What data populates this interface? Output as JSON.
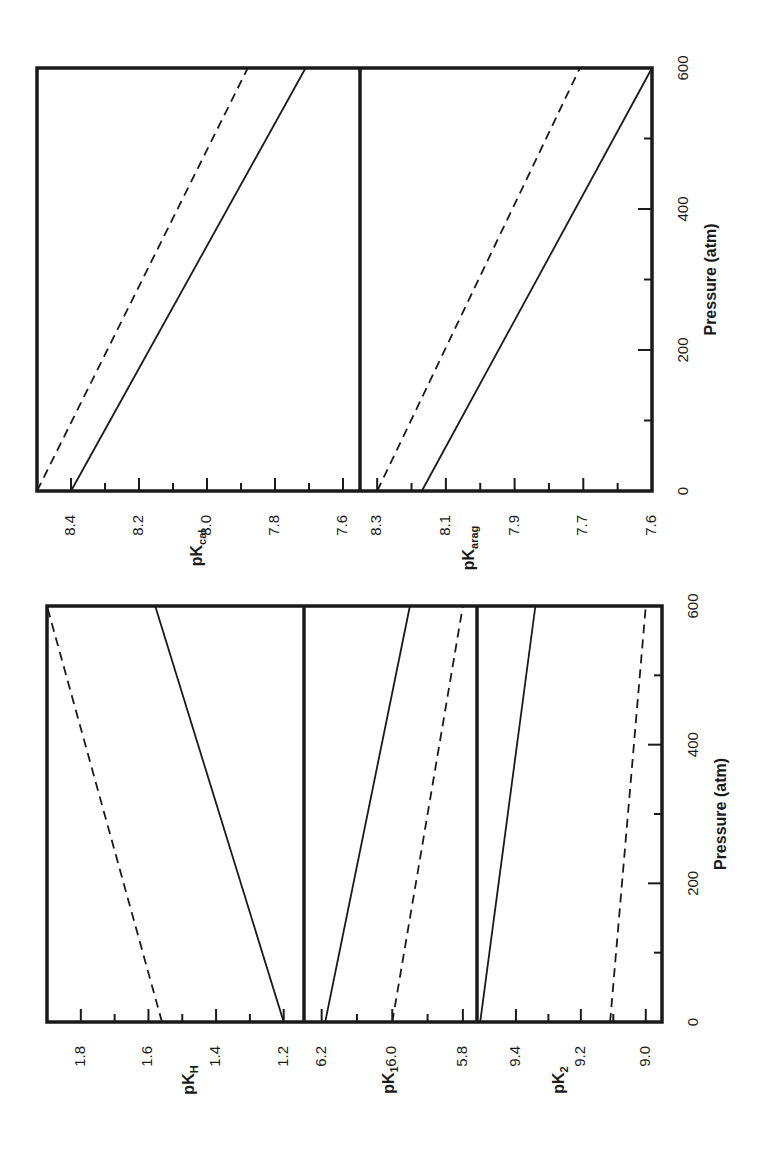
{
  "figure": {
    "orientation": "rotated-90-ccw",
    "ink_color": "#1a1a1a",
    "background": "#ffffff"
  },
  "chart_data": [
    {
      "type": "line",
      "panel_id": "pKcal",
      "ylabel_main": "pK",
      "ylabel_sub": "cal",
      "xlabel": "Pressure (atm)",
      "x_ticks": [
        0,
        200,
        400,
        600
      ],
      "x_minor_ticks": [
        100,
        300,
        500
      ],
      "xlim": [
        0,
        600
      ],
      "y_tick_labels": [
        "8.4",
        "8.2",
        "8.0",
        "7.8",
        "7.6"
      ],
      "y_tick_values": [
        8.4,
        8.2,
        8.0,
        7.8,
        7.6
      ],
      "y_minor_ticks": [
        8.3,
        8.1,
        7.9,
        7.7
      ],
      "ylim": [
        8.5,
        7.55
      ],
      "series": [
        {
          "name": "solid",
          "style": "solid",
          "x": [
            0,
            600
          ],
          "y": [
            8.4,
            7.71
          ]
        },
        {
          "name": "dashed",
          "style": "dashed",
          "x": [
            0,
            600
          ],
          "y": [
            8.5,
            7.88
          ]
        }
      ]
    },
    {
      "type": "line",
      "panel_id": "pKarag",
      "ylabel_main": "pK",
      "ylabel_sub": "arag",
      "xlabel": "Pressure (atm)",
      "x_ticks": [
        0,
        200,
        400,
        600
      ],
      "x_minor_ticks": [
        100,
        300,
        500
      ],
      "xlim": [
        0,
        600
      ],
      "y_tick_labels": [
        "8.3",
        "8.1",
        "7.9",
        "7.7",
        "7.6"
      ],
      "y_tick_values": [
        8.3,
        8.1,
        7.9,
        7.7,
        7.5
      ],
      "y_minor_ticks": [
        8.2,
        8.0,
        7.8,
        7.6
      ],
      "ylim": [
        8.35,
        7.5
      ],
      "series": [
        {
          "name": "solid",
          "style": "solid",
          "x": [
            0,
            600
          ],
          "y": [
            8.17,
            7.5
          ]
        },
        {
          "name": "dashed",
          "style": "dashed",
          "x": [
            0,
            600
          ],
          "y": [
            8.3,
            7.71
          ]
        }
      ]
    },
    {
      "type": "line",
      "panel_id": "pKH",
      "ylabel_main": "pK",
      "ylabel_sub": "H",
      "xlabel": "Pressure (atm)",
      "x_ticks": [
        0,
        200,
        400,
        600
      ],
      "x_minor_ticks": [
        100,
        300,
        500
      ],
      "xlim": [
        0,
        600
      ],
      "y_tick_labels": [
        "1.8",
        "1.6",
        "1.4",
        "1.2"
      ],
      "y_tick_values": [
        1.8,
        1.6,
        1.4,
        1.2
      ],
      "y_minor_ticks": [
        1.7,
        1.5,
        1.3
      ],
      "ylim": [
        1.9,
        1.14
      ],
      "series": [
        {
          "name": "solid",
          "style": "solid",
          "x": [
            0,
            600
          ],
          "y": [
            1.2,
            1.58
          ]
        },
        {
          "name": "dashed",
          "style": "dashed",
          "x": [
            0,
            600
          ],
          "y": [
            1.56,
            1.9
          ]
        }
      ]
    },
    {
      "type": "line",
      "panel_id": "pK1",
      "ylabel_main": "pK",
      "ylabel_sub": "1",
      "xlabel": "Pressure (atm)",
      "x_ticks": [
        0,
        200,
        400,
        600
      ],
      "x_minor_ticks": [
        100,
        300,
        500
      ],
      "xlim": [
        0,
        600
      ],
      "y_tick_labels": [
        "6.2",
        "6.0",
        "5.8"
      ],
      "y_tick_values": [
        6.2,
        6.0,
        5.8
      ],
      "y_minor_ticks": [
        6.1,
        5.9
      ],
      "ylim": [
        6.25,
        5.76
      ],
      "series": [
        {
          "name": "solid",
          "style": "solid",
          "x": [
            0,
            600
          ],
          "y": [
            6.19,
            5.95
          ]
        },
        {
          "name": "dashed",
          "style": "dashed",
          "x": [
            0,
            600
          ],
          "y": [
            6.0,
            5.8
          ]
        }
      ]
    },
    {
      "type": "line",
      "panel_id": "pK2",
      "ylabel_main": "pK",
      "ylabel_sub": "2",
      "xlabel": "Pressure (atm)",
      "x_ticks": [
        0,
        200,
        400,
        600
      ],
      "x_minor_ticks": [
        100,
        300,
        500
      ],
      "xlim": [
        0,
        600
      ],
      "y_tick_labels": [
        "9.4",
        "9.2",
        "9.0"
      ],
      "y_tick_values": [
        9.4,
        9.2,
        9.0
      ],
      "y_minor_ticks": [
        9.3,
        9.1
      ],
      "ylim": [
        9.52,
        8.95
      ],
      "series": [
        {
          "name": "solid",
          "style": "solid",
          "x": [
            0,
            600
          ],
          "y": [
            9.51,
            9.34
          ]
        },
        {
          "name": "dashed",
          "style": "dashed",
          "x": [
            0,
            600
          ],
          "y": [
            9.11,
            9.0
          ]
        }
      ]
    }
  ],
  "layout": {
    "figures": [
      {
        "id": "top",
        "pressure_axis": {
          "y_at_0": 491,
          "y_at_600": 68,
          "line_x": 652,
          "label_x": 684,
          "title_x": 712,
          "title": "Pressure (atm)"
        },
        "frame": {
          "x0": 37,
          "x1": 652,
          "y0": 68,
          "y1": 491
        },
        "panels": [
          {
            "panel_id": "pKcal",
            "x0": 37,
            "x1": 360,
            "val_x0": 8.5,
            "val_x1": 7.55,
            "label_x": 198,
            "label_y": 548
          },
          {
            "panel_id": "pKarag",
            "x0": 360,
            "x1": 652,
            "val_x0": 8.35,
            "val_x1": 7.5,
            "label_x": 470,
            "label_y": 548
          }
        ]
      },
      {
        "id": "bottom",
        "pressure_axis": {
          "y_at_0": 1022,
          "y_at_600": 606,
          "line_x": 662,
          "label_x": 694,
          "title_x": 722,
          "title": "Pressure (atm)"
        },
        "frame": {
          "x0": 47,
          "x1": 662,
          "y0": 606,
          "y1": 1022
        },
        "panels": [
          {
            "panel_id": "pKH",
            "x0": 47,
            "x1": 304,
            "val_x0": 1.9,
            "val_x1": 1.14,
            "label_x": 190,
            "label_y": 1080
          },
          {
            "panel_id": "pK1",
            "x0": 304,
            "x1": 477,
            "val_x0": 6.25,
            "val_x1": 5.76,
            "label_x": 390,
            "label_y": 1080
          },
          {
            "panel_id": "pK2",
            "x0": 477,
            "x1": 662,
            "val_x0": 9.52,
            "val_x1": 8.95,
            "label_x": 560,
            "label_y": 1080
          }
        ]
      }
    ]
  }
}
